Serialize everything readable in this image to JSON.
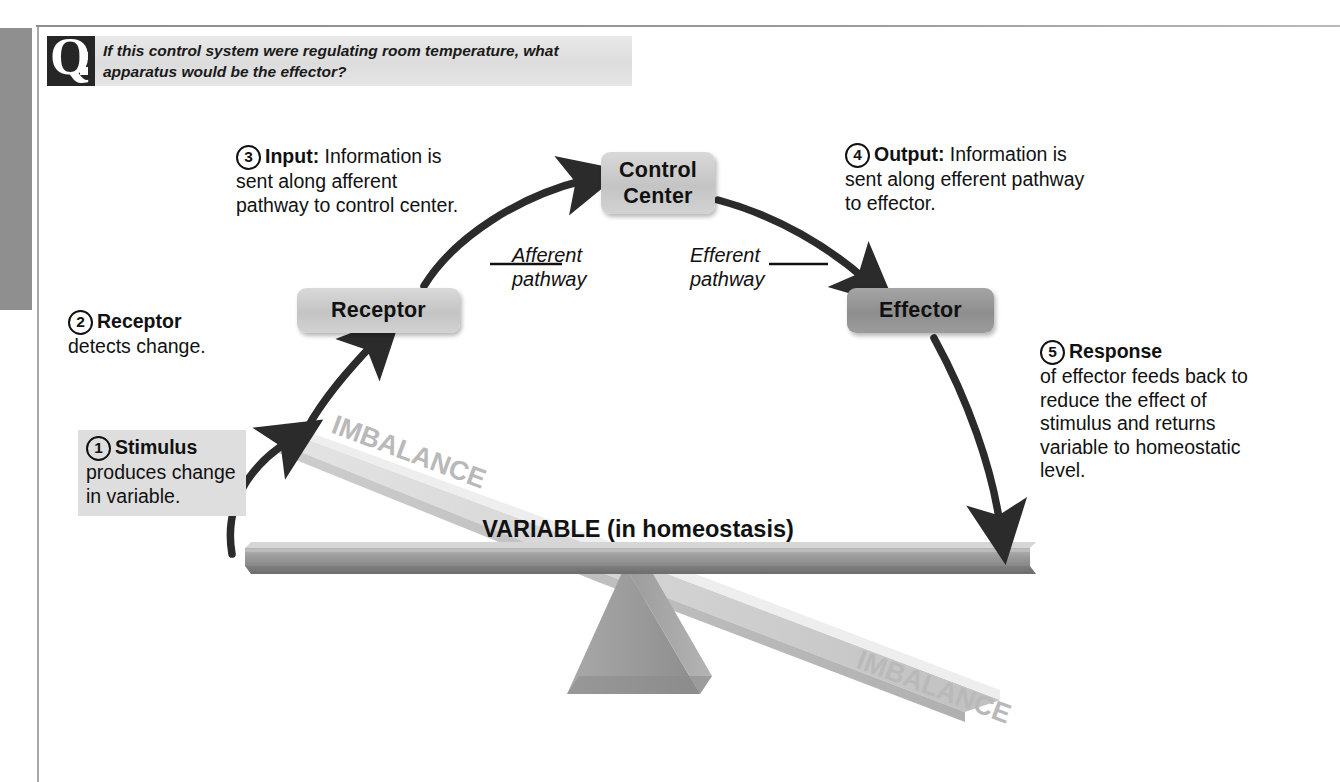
{
  "question": {
    "badge_letter": "Q",
    "badge_icon": "question-colon-icon",
    "text": "If this control system were regulating room temperature, what apparatus would be the effector?"
  },
  "nodes": [
    {
      "id": "receptor",
      "label": "Receptor",
      "style": "light"
    },
    {
      "id": "control_center",
      "label": "Control\nCenter",
      "label_line1": "Control",
      "label_line2": "Center",
      "style": "light"
    },
    {
      "id": "effector",
      "label": "Effector",
      "style": "dark"
    }
  ],
  "pathways": [
    {
      "id": "afferent",
      "line1": "Afferent",
      "line2": "pathway"
    },
    {
      "id": "efferent",
      "line1": "Efferent",
      "line2": "pathway"
    }
  ],
  "callouts": [
    {
      "number": "1",
      "title": "Stimulus",
      "body": "produces change in variable.",
      "highlighted": true
    },
    {
      "number": "2",
      "title": "Receptor",
      "body": "detects change.",
      "highlighted": false
    },
    {
      "number": "3",
      "title": "Input:",
      "body": "Information is sent along afferent pathway to control center.",
      "highlighted": false
    },
    {
      "number": "4",
      "title": "Output:",
      "body": "Information is sent along efferent pathway to effector.",
      "highlighted": false
    },
    {
      "number": "5",
      "title": "Response",
      "body": "of effector feeds back to reduce the effect of stimulus and returns variable to homeostatic level.",
      "highlighted": false
    }
  ],
  "balance": {
    "variable_label": "VARIABLE (in homeostasis)",
    "imbalance_upper": "IMBALANCE",
    "imbalance_lower": "IMBALANCE"
  },
  "colors": {
    "ink": "#111111",
    "box_light": "#c9c9c9",
    "box_dark": "#939393",
    "beam_level": "#8f8f8f",
    "beam_tilted": "#cfcfcf",
    "fulcrum": "#9a9a9a",
    "highlight_band": "#dedede",
    "badge": "#262626"
  }
}
